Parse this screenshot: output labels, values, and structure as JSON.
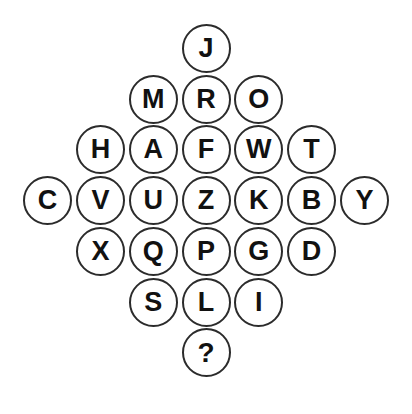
{
  "puzzle": {
    "type": "letter-circle-diamond",
    "shape": "diamond",
    "background_color": "#ffffff",
    "circle_outline_color": "#2b2b2b",
    "letter_color": "#111111",
    "circle_diameter_px": 49,
    "row_counts": [
      1,
      3,
      5,
      7,
      5,
      3,
      1
    ],
    "unknown_marker": "?",
    "rows": [
      {
        "index": 1,
        "cells": [
          "J"
        ]
      },
      {
        "index": 2,
        "cells": [
          "M",
          "R",
          "O"
        ]
      },
      {
        "index": 3,
        "cells": [
          "H",
          "A",
          "F",
          "W",
          "T"
        ]
      },
      {
        "index": 4,
        "cells": [
          "C",
          "V",
          "U",
          "Z",
          "K",
          "B",
          "Y"
        ]
      },
      {
        "index": 5,
        "cells": [
          "X",
          "Q",
          "P",
          "G",
          "D"
        ]
      },
      {
        "index": 6,
        "cells": [
          "S",
          "L",
          "I"
        ]
      },
      {
        "index": 7,
        "cells": [
          "?"
        ]
      }
    ]
  }
}
